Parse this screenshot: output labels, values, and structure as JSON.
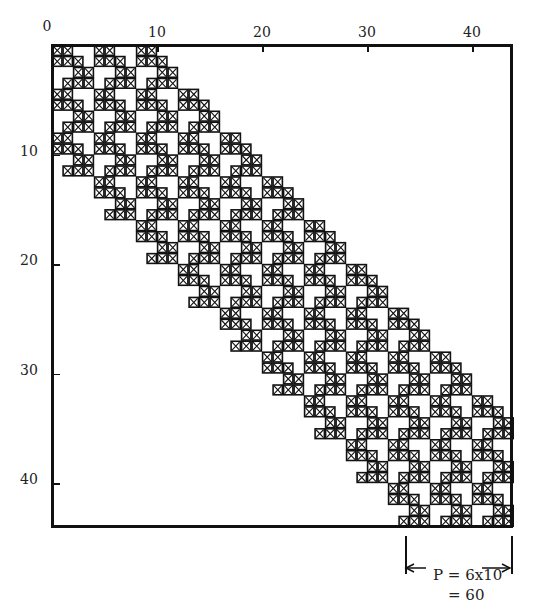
{
  "figure": {
    "type": "sparse-matrix-nonzero-pattern",
    "matrix_size": 44,
    "tile_size": 4,
    "tile_band_halfwidth": 2,
    "tile_pattern": [
      [
        0,
        1
      ],
      [
        0,
        1,
        2
      ],
      [
        2,
        3
      ],
      [
        1,
        2,
        3
      ]
    ],
    "x_axis": {
      "ticks": [
        0,
        10,
        20,
        30,
        40
      ],
      "labels": [
        "0",
        "10",
        "20",
        "30",
        "40"
      ],
      "position": "top"
    },
    "y_axis": {
      "ticks": [
        10,
        20,
        30,
        40
      ],
      "labels": [
        "10",
        "20",
        "30",
        "40"
      ],
      "position": "left"
    },
    "cell_marker": "boxed-x",
    "colors": {
      "ink": "#111111",
      "background": "#ffffff"
    }
  },
  "annotation": {
    "line1": "P = 6x10",
    "line2": "= 60",
    "arrow_span_cols": [
      34,
      44
    ]
  }
}
